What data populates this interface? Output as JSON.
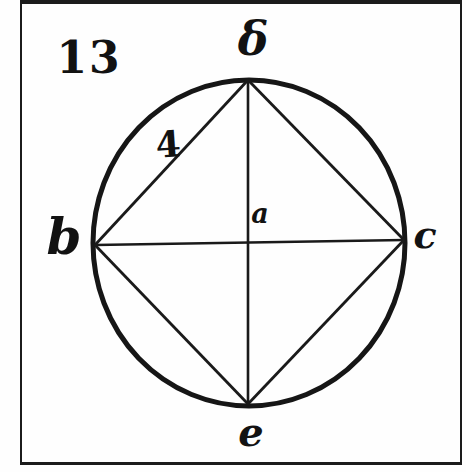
{
  "figure": {
    "number": "13",
    "segment_label": "4"
  },
  "points": {
    "top": "δ",
    "left": "b",
    "right": "c",
    "bottom": "e",
    "center": "a"
  },
  "colors": {
    "ink": "#121212",
    "line": "#1a1a1a",
    "paper": "#fefefe"
  }
}
